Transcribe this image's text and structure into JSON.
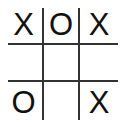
{
  "board": {
    "title": "Tic-Tac-Toe Board",
    "rows": 3,
    "columns": 3,
    "colors": {
      "background": "#ffffff",
      "grid_line": "#333333",
      "mark": "#111111"
    },
    "grid": {
      "vertical_lines": 2,
      "horizontal_lines": 2
    },
    "cells": [
      {
        "id": "cell-0-0",
        "row": 0,
        "col": 0,
        "mark": "X"
      },
      {
        "id": "cell-0-1",
        "row": 0,
        "col": 1,
        "mark": "O"
      },
      {
        "id": "cell-0-2",
        "row": 0,
        "col": 2,
        "mark": "X"
      },
      {
        "id": "cell-1-0",
        "row": 1,
        "col": 0,
        "mark": ""
      },
      {
        "id": "cell-1-1",
        "row": 1,
        "col": 1,
        "mark": ""
      },
      {
        "id": "cell-1-2",
        "row": 1,
        "col": 2,
        "mark": ""
      },
      {
        "id": "cell-2-0",
        "row": 2,
        "col": 0,
        "mark": "O"
      },
      {
        "id": "cell-2-1",
        "row": 2,
        "col": 1,
        "mark": ""
      },
      {
        "id": "cell-2-2",
        "row": 2,
        "col": 2,
        "mark": "X"
      }
    ]
  }
}
